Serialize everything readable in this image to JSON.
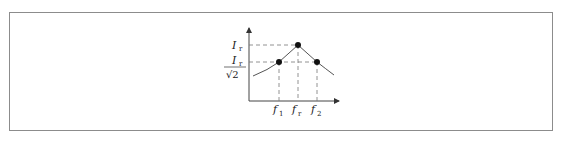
{
  "figure": {
    "type": "resonance-curve",
    "y_axis": {
      "labels": [
        {
          "base": "I",
          "sub": "r",
          "meaning": "peak current"
        },
        {
          "numerator_base": "I",
          "numerator_sub": "r",
          "denominator": "√2",
          "meaning": "half-power current"
        }
      ]
    },
    "x_axis": {
      "labels": [
        {
          "base": "f",
          "sub": "1"
        },
        {
          "base": "f",
          "sub": "r"
        },
        {
          "base": "f",
          "sub": "2"
        }
      ]
    },
    "points": [
      {
        "name": "f1-point",
        "x": 279,
        "y": 62
      },
      {
        "name": "fr-peak",
        "x": 298,
        "y": 45
      },
      {
        "name": "f2-point",
        "x": 317,
        "y": 62
      }
    ],
    "colors": {
      "axis": "#444444",
      "curve": "#555555",
      "dashed": "#777777",
      "point": "#111111",
      "frame": "#8c8c8c"
    }
  }
}
